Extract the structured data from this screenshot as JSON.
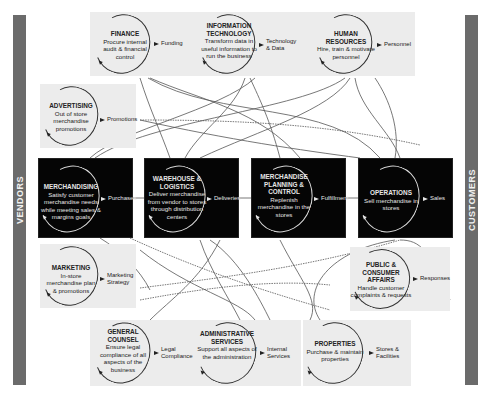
{
  "sides": {
    "left": "VENDORS",
    "right": "CUSTOMERS"
  },
  "core_functions": [
    {
      "id": "merchandising",
      "title": "MERCHANDISING",
      "desc": "Satisfy customer merchandise needs while meeting sales & margins goals",
      "output": "Purchases"
    },
    {
      "id": "warehouse",
      "title": "WAREHOUSE & LOGISTICS",
      "desc": "Deliver merchandise from vendor to stores through distribution centers",
      "output": "Deliveries"
    },
    {
      "id": "planning",
      "title": "MERCHANDISE PLANNING & CONTROL",
      "desc": "Replenish merchandise in the stores",
      "output": "Fulfillment"
    },
    {
      "id": "operations",
      "title": "OPERATIONS",
      "desc": "Sell merchandise in stores",
      "output": "Sales"
    }
  ],
  "support_top": [
    {
      "id": "finance",
      "title": "FINANCE",
      "desc": "Procure internal audit & financial control",
      "output": "Funding"
    },
    {
      "id": "it",
      "title": "INFORMATION TECHNOLOGY",
      "desc": "Transform data in useful information to run the business",
      "output": "Technology & Data"
    },
    {
      "id": "hr",
      "title": "HUMAN RESOURCES",
      "desc": "Hire, train & motivate personnel",
      "output": "Personnel"
    }
  ],
  "support_left": [
    {
      "id": "advertising",
      "title": "ADVERTISING",
      "desc": "Out of store merchandise promotions",
      "output": "Promotions"
    },
    {
      "id": "marketing",
      "title": "MARKETING",
      "desc": "In-store merchandise plan & promotions",
      "output": "Marketing Strategy"
    }
  ],
  "support_right": [
    {
      "id": "public",
      "title": "PUBLIC & CONSUMER AFFAIRS",
      "desc": "Handle customer complaints & requests",
      "output": "Responses"
    }
  ],
  "support_bottom": [
    {
      "id": "counsel",
      "title": "GENERAL COUNSEL",
      "desc": "Ensure legal compliance of all aspects of the business",
      "output": "Legal Compliance"
    },
    {
      "id": "admin",
      "title": "ADMINISTRATIVE SERVICES",
      "desc": "Support all aspects of the administration",
      "output": "Internal Services"
    },
    {
      "id": "properties",
      "title": "PROPERTIES",
      "desc": "Purchase & maintain properties",
      "output": "Stores & Facilities"
    }
  ],
  "colors": {
    "side_bar": "#6b6b6b",
    "core_box": "#050505",
    "support_box": "#ececec",
    "line": "#555555"
  }
}
